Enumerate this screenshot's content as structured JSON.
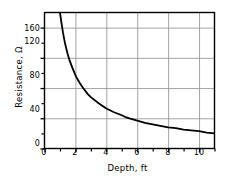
{
  "chart_data": {
    "type": "line",
    "title": "",
    "xlabel": "Depth, ft",
    "ylabel": "Resistance, Ω",
    "xlim": [
      0,
      11
    ],
    "ylim": [
      0,
      180
    ],
    "grid": true,
    "legend": "none",
    "x_major_ticks": [
      0,
      2,
      4,
      6,
      8,
      10
    ],
    "x_minor_ticks": [
      1,
      3,
      5,
      7,
      9,
      11
    ],
    "y_major_ticks": [
      0,
      40,
      80,
      120,
      160
    ],
    "y_minor_ticks": [
      20,
      60,
      100,
      140
    ],
    "x_tick_labels": [
      "0",
      "2",
      "4",
      "6",
      "8",
      "10"
    ],
    "y_tick_labels": [
      "0",
      "40",
      "80",
      "120",
      "160"
    ],
    "series": [
      {
        "name": "Resistance",
        "color": "#000000",
        "x": [
          0.95,
          1.0,
          1.1,
          1.2,
          1.3,
          1.4,
          1.5,
          1.6,
          1.8,
          2.0,
          2.1,
          2.3,
          2.5,
          2.8,
          3.0,
          3.5,
          4.0,
          4.5,
          5.0,
          5.2,
          5.5,
          6.0,
          6.5,
          7.0,
          7.5,
          8.0,
          8.5,
          9.0,
          9.5,
          10.0,
          10.5,
          11.0
        ],
        "y": [
          190,
          180,
          166,
          153,
          142,
          133,
          125,
          118,
          107,
          97,
          93,
          86,
          80,
          72,
          68,
          60,
          53,
          48,
          44,
          42,
          40,
          37,
          34,
          32,
          30,
          28,
          27,
          25,
          24,
          23,
          21,
          20
        ]
      }
    ]
  },
  "axes": {
    "frame_color": "#000000",
    "grid_color": "#9a9a9a",
    "background": "#ffffff"
  }
}
